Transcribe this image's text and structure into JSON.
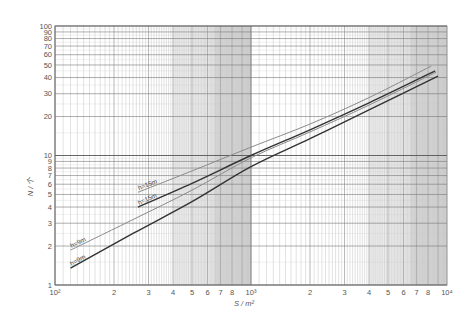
{
  "chart_data": {
    "type": "line",
    "scale": {
      "x": "log",
      "y": "log"
    },
    "title": "",
    "xlabel": "S / m²",
    "ylabel": "N / 个",
    "xlim": [
      100,
      10000
    ],
    "ylim": [
      1,
      100
    ],
    "grid": true,
    "x_tick_labels": [
      "10²",
      "2",
      "3",
      "4",
      "5",
      "6",
      "7",
      "8",
      "10³",
      "2",
      "3",
      "4",
      "5",
      "6",
      "7",
      "8",
      "10⁴"
    ],
    "x_tick_values": [
      100,
      200,
      300,
      400,
      500,
      600,
      700,
      800,
      1000,
      2000,
      3000,
      4000,
      5000,
      6000,
      7000,
      8000,
      10000
    ],
    "y_tick_labels": [
      "1",
      "2",
      "3",
      "4",
      "5",
      "6",
      "7",
      "8",
      "9",
      "10",
      "20",
      "30",
      "40",
      "50",
      "60",
      "70",
      "80",
      "90",
      "100"
    ],
    "y_tick_values": [
      1,
      2,
      3,
      4,
      5,
      6,
      7,
      8,
      9,
      10,
      20,
      30,
      40,
      50,
      60,
      70,
      80,
      90,
      100
    ],
    "series": [
      {
        "name": "h=15m",
        "color": "#8a8a8a",
        "width": 1.0,
        "label_pos": {
          "x": 265,
          "y": 5.2
        },
        "x": [
          265,
          500,
          1000,
          2000,
          4000,
          8300
        ],
        "y": [
          5.2,
          7.6,
          11.6,
          17.5,
          28,
          49
        ]
      },
      {
        "name": "h=15m",
        "color": "#333333",
        "width": 1.4,
        "label_pos": {
          "x": 265,
          "y": 4.0
        },
        "x": [
          265,
          500,
          1000,
          2000,
          4000,
          8700
        ],
        "y": [
          4.0,
          6.1,
          10.0,
          15.8,
          25.5,
          45
        ]
      },
      {
        "name": "h=9m",
        "color": "#8a8a8a",
        "width": 1.0,
        "label_pos": {
          "x": 120,
          "y": 1.86
        },
        "x": [
          120,
          250,
          500,
          1000,
          2000,
          4000,
          8800
        ],
        "y": [
          1.86,
          3.2,
          5.4,
          9.6,
          15.2,
          24.5,
          44
        ]
      },
      {
        "name": "h=9m",
        "color": "#333333",
        "width": 1.4,
        "label_pos": {
          "x": 120,
          "y": 1.35
        },
        "x": [
          120,
          250,
          500,
          1000,
          2000,
          4000,
          9000
        ],
        "y": [
          1.35,
          2.5,
          4.4,
          8.2,
          13.5,
          22.5,
          41
        ]
      }
    ]
  }
}
